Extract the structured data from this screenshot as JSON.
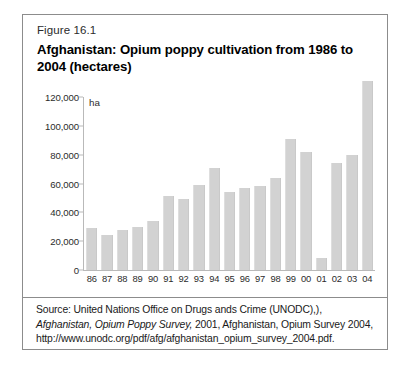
{
  "figure": {
    "label": "Figure 16.1",
    "title": "Afghanistan: Opium poppy cultivation from 1986 to 2004 (hectares)"
  },
  "source": {
    "prefix": "Source: United Nations Office on Drugs ands Crime (UNODC),),",
    "italic_1": "Afghanistan, Opium Poppy Survey,",
    "middle": " 2001, Afghanistan, Opium Survey 2004, http://www.unodc.org/pdf/afg/afghanistan_opium_survey_2004.pdf."
  },
  "colors": {
    "bar": "#d2d2d2",
    "border": "#8c8c8c",
    "axis": "#b9b9b9",
    "text": "#1a1a1a",
    "background": "#ffffff"
  },
  "chart_data": {
    "type": "bar",
    "title": "Afghanistan: Opium poppy cultivation from 1986 to 2004 (hectares)",
    "xlabel": "",
    "ylabel": "ha",
    "unit": "ha",
    "ylim": [
      0,
      120000
    ],
    "ytick_labels": [
      "120,000",
      "100,000",
      "80,000",
      "60,000",
      "40,000",
      "20,000",
      "0"
    ],
    "yticks": [
      120000,
      100000,
      80000,
      60000,
      40000,
      20000,
      0
    ],
    "grid": false,
    "legend": false,
    "categories": [
      "86",
      "87",
      "88",
      "89",
      "90",
      "91",
      "92",
      "93",
      "94",
      "95",
      "96",
      "97",
      "98",
      "99",
      "00",
      "01",
      "02",
      "03",
      "04"
    ],
    "values": [
      29000,
      24000,
      28000,
      30000,
      34000,
      51000,
      49000,
      59000,
      71000,
      54000,
      57000,
      58000,
      64000,
      91000,
      82000,
      8000,
      74000,
      80000,
      131000
    ]
  }
}
